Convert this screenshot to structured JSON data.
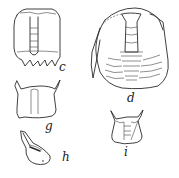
{
  "figure": {
    "panels": [
      {
        "id": "c",
        "label": "c",
        "subject": "cephalon with glabella (dorsal view)"
      },
      {
        "id": "d",
        "label": "d",
        "subject": "complete trilobite with pygidium segments"
      },
      {
        "id": "g",
        "label": "g",
        "subject": "cranidium"
      },
      {
        "id": "h",
        "label": "h",
        "subject": "lateral view of fragment"
      },
      {
        "id": "i",
        "label": "i",
        "subject": "cranidium with spines"
      }
    ],
    "colors": {
      "ink": "#2a2a2a",
      "background": "#ffffff"
    }
  }
}
